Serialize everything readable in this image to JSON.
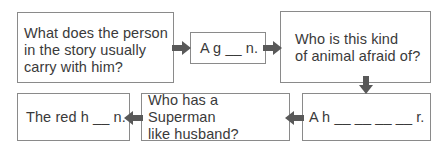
{
  "diagram": {
    "colors": {
      "border": "#8a8a8a",
      "arrow": "#595959",
      "text": "#3a3a3a",
      "background": "#ffffff"
    },
    "boxes": [
      {
        "id": "box1",
        "role": "question",
        "text": "What does the person\nin the story usually\ncarry with him?"
      },
      {
        "id": "box2",
        "role": "answer",
        "text": "A g __ n."
      },
      {
        "id": "box3",
        "role": "question",
        "text": "Who is this kind\nof animal afraid of?"
      },
      {
        "id": "box4",
        "role": "answer",
        "text": "A h __ __ __ __ r."
      },
      {
        "id": "box5",
        "role": "question",
        "text": "Who has a Superman\nlike husband?"
      },
      {
        "id": "box6",
        "role": "answer",
        "text": "The red h __ n."
      }
    ],
    "arrows": [
      {
        "from": "box1",
        "to": "box2",
        "direction": "right"
      },
      {
        "from": "box2",
        "to": "box3",
        "direction": "right"
      },
      {
        "from": "box3",
        "to": "box4",
        "direction": "down"
      },
      {
        "from": "box4",
        "to": "box5",
        "direction": "left"
      },
      {
        "from": "box5",
        "to": "box6",
        "direction": "left"
      }
    ]
  }
}
